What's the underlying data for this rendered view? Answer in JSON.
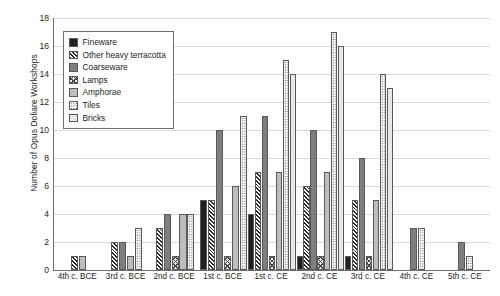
{
  "chart_data": {
    "type": "bar",
    "title": "",
    "xlabel": "",
    "ylabel": "Number of Opus Doliare Workshops",
    "ylim": [
      0,
      18
    ],
    "ytick_step": 2,
    "yticks": [
      0,
      2,
      4,
      6,
      8,
      10,
      12,
      14,
      16,
      18
    ],
    "grid": true,
    "legend_position": "upper-left-inside",
    "categories": [
      "4th c. BCE",
      "3rd c. BCE",
      "2nd c. BCE",
      "1st c. BCE",
      "1st c. CE",
      "2nd c. CE",
      "3rd c. CE",
      "4th c. CE",
      "5th c. CE"
    ],
    "series": [
      {
        "name": "Fineware",
        "pattern": "solid-black",
        "color": "#231f20",
        "values": [
          0,
          0,
          0,
          5,
          4,
          1,
          1,
          0,
          0
        ]
      },
      {
        "name": "Other heavy terracotta",
        "pattern": "diagonal-hatch",
        "color": "#2b2b2b",
        "values": [
          1,
          2,
          3,
          5,
          7,
          6,
          5,
          0,
          0
        ]
      },
      {
        "name": "Coarseware",
        "pattern": "solid-dark-gray",
        "color": "#7d7e80",
        "values": [
          0,
          2,
          4,
          10,
          11,
          10,
          8,
          3,
          2
        ]
      },
      {
        "name": "Lamps",
        "pattern": "cross-hatch",
        "color": "#444444",
        "values": [
          0,
          0,
          1,
          1,
          1,
          1,
          1,
          0,
          0
        ]
      },
      {
        "name": "Amphorae",
        "pattern": "solid-light-gray",
        "color": "#bcbdbf",
        "values": [
          1,
          1,
          4,
          6,
          7,
          7,
          5,
          0,
          0
        ]
      },
      {
        "name": "Tiles",
        "pattern": "dotted",
        "color": "#4a4a4a",
        "values": [
          0,
          3,
          4,
          11,
          15,
          17,
          14,
          3,
          1
        ]
      },
      {
        "name": "Bricks",
        "pattern": "white-empty",
        "color": "#e8e8e6",
        "values": [
          0,
          0,
          0,
          0,
          14,
          16,
          13,
          0,
          0
        ]
      }
    ]
  },
  "legend": {
    "items": [
      {
        "label": "Fineware"
      },
      {
        "label": "Other heavy terracotta"
      },
      {
        "label": "Coarseware"
      },
      {
        "label": "Lamps"
      },
      {
        "label": "Amphorae"
      },
      {
        "label": "Tiles"
      },
      {
        "label": "Bricks"
      }
    ]
  }
}
